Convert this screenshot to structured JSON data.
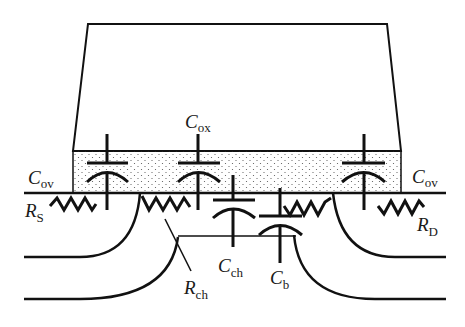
{
  "diagram": {
    "colors": {
      "line": "#111111",
      "oxide_dots": "#555555",
      "background": "#ffffff"
    },
    "labels": {
      "cox": {
        "main": "C",
        "sub": "ox"
      },
      "cov_left": {
        "main": "C",
        "sub": "ov"
      },
      "cov_right": {
        "main": "C",
        "sub": "ov"
      },
      "rs": {
        "main": "R",
        "sub": "S"
      },
      "rd": {
        "main": "R",
        "sub": "D"
      },
      "cch": {
        "main": "C",
        "sub": "ch"
      },
      "rch": {
        "main": "R",
        "sub": "ch"
      },
      "cb": {
        "main": "C",
        "sub": "b"
      }
    },
    "elements": [
      "gate",
      "gate-oxide",
      "source-overlap-capacitor",
      "gate-oxide-capacitor",
      "channel-capacitor",
      "body-capacitor",
      "drain-overlap-capacitor",
      "source-resistor",
      "channel-resistor",
      "drain-resistor",
      "source-junction",
      "drain-junction"
    ]
  }
}
